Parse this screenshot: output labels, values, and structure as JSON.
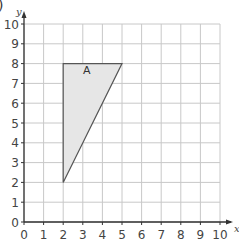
{
  "figure": {
    "corner_label": ")",
    "shape_label": "A"
  },
  "chart_data": {
    "type": "scatter",
    "title": "",
    "xlabel": "x",
    "ylabel": "y",
    "xlim": [
      0,
      10
    ],
    "ylim": [
      0,
      10
    ],
    "grid": true,
    "x_ticks": [
      "0",
      "1",
      "2",
      "3",
      "4",
      "5",
      "6",
      "7",
      "8",
      "9",
      "10"
    ],
    "y_ticks": [
      "0",
      "1",
      "2",
      "3",
      "4",
      "5",
      "6",
      "7",
      "8",
      "9",
      "10"
    ],
    "shapes": [
      {
        "name": "A",
        "kind": "triangle",
        "vertices": [
          [
            2,
            8
          ],
          [
            5,
            8
          ],
          [
            2,
            2
          ]
        ],
        "fill": "#e6e6e6",
        "stroke": "#555555"
      }
    ]
  },
  "style": {
    "grid_color": "#c8c8c8",
    "axis_color": "#333333",
    "text_color": "#444444"
  }
}
